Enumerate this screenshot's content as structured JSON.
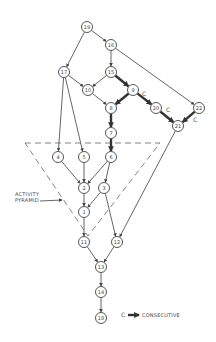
{
  "nodes": [
    {
      "id": "19",
      "x": 87,
      "y": 27
    },
    {
      "id": "16",
      "x": 111,
      "y": 45
    },
    {
      "id": "17",
      "x": 64,
      "y": 72
    },
    {
      "id": "15",
      "x": 111,
      "y": 72
    },
    {
      "id": "10",
      "x": 88,
      "y": 90
    },
    {
      "id": "9",
      "x": 133,
      "y": 90
    },
    {
      "id": "8",
      "x": 111,
      "y": 108
    },
    {
      "id": "20",
      "x": 156,
      "y": 108
    },
    {
      "id": "22",
      "x": 199,
      "y": 108
    },
    {
      "id": "21",
      "x": 178,
      "y": 126
    },
    {
      "id": "7",
      "x": 111,
      "y": 133
    },
    {
      "id": "4",
      "x": 58,
      "y": 157
    },
    {
      "id": "5",
      "x": 84,
      "y": 157
    },
    {
      "id": "6",
      "x": 111,
      "y": 157
    },
    {
      "id": "2",
      "x": 84,
      "y": 188
    },
    {
      "id": "3",
      "x": 104,
      "y": 188
    },
    {
      "id": "1",
      "x": 84,
      "y": 212
    },
    {
      "id": "11",
      "x": 84,
      "y": 242
    },
    {
      "id": "12",
      "x": 117,
      "y": 242
    },
    {
      "id": "13",
      "x": 101,
      "y": 267
    },
    {
      "id": "14",
      "x": 101,
      "y": 292
    },
    {
      "id": "18",
      "x": 101,
      "y": 318
    }
  ],
  "edges": [
    {
      "from": "19",
      "to": "16",
      "consecutive": false
    },
    {
      "from": "19",
      "to": "17",
      "consecutive": false
    },
    {
      "from": "16",
      "to": "15",
      "consecutive": false
    },
    {
      "from": "16",
      "to": "22",
      "consecutive": false
    },
    {
      "from": "17",
      "to": "10",
      "consecutive": false
    },
    {
      "from": "17",
      "to": "4",
      "consecutive": false
    },
    {
      "from": "17",
      "to": "5",
      "consecutive": false
    },
    {
      "from": "15",
      "to": "10",
      "consecutive": false
    },
    {
      "from": "15",
      "to": "9",
      "consecutive": true
    },
    {
      "from": "10",
      "to": "8",
      "consecutive": false
    },
    {
      "from": "9",
      "to": "8",
      "consecutive": true
    },
    {
      "from": "9",
      "to": "20",
      "consecutive": true,
      "label": "C"
    },
    {
      "from": "20",
      "to": "21",
      "consecutive": true,
      "label": "C"
    },
    {
      "from": "22",
      "to": "21",
      "consecutive": true,
      "label": "C"
    },
    {
      "from": "8",
      "to": "7",
      "consecutive": true
    },
    {
      "from": "7",
      "to": "6",
      "consecutive": true
    },
    {
      "from": "21",
      "to": "12",
      "consecutive": false
    },
    {
      "from": "4",
      "to": "2",
      "consecutive": false
    },
    {
      "from": "5",
      "to": "2",
      "consecutive": false
    },
    {
      "from": "6",
      "to": "2",
      "consecutive": false
    },
    {
      "from": "6",
      "to": "3",
      "consecutive": false
    },
    {
      "from": "2",
      "to": "1",
      "consecutive": false
    },
    {
      "from": "3",
      "to": "1",
      "consecutive": false
    },
    {
      "from": "3",
      "to": "12",
      "consecutive": false
    },
    {
      "from": "1",
      "to": "11",
      "consecutive": false
    },
    {
      "from": "11",
      "to": "13",
      "consecutive": false
    },
    {
      "from": "12",
      "to": "13",
      "consecutive": false
    },
    {
      "from": "13",
      "to": "14",
      "consecutive": false
    },
    {
      "from": "14",
      "to": "18",
      "consecutive": false
    }
  ],
  "edge_labels": [
    {
      "text": "C",
      "x": 142,
      "y": 96
    },
    {
      "text": "C",
      "x": 166,
      "y": 112
    },
    {
      "text": "C",
      "x": 193,
      "y": 122
    }
  ],
  "pyramid": {
    "label_line1": "ACTIVITY",
    "label_line2": "PYRAMID",
    "points": [
      [
        25,
        143
      ],
      [
        160,
        143
      ],
      [
        88,
        236
      ]
    ]
  },
  "legend": {
    "symbol": "C",
    "label": "CONSECUTIVE"
  }
}
